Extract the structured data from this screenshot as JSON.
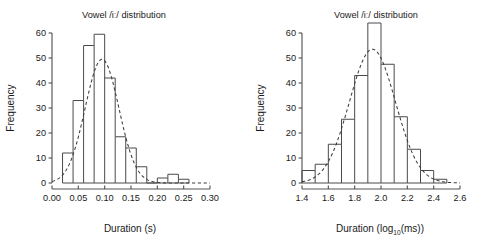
{
  "figure": {
    "background": "#ffffff",
    "ink_color": "#1a1a1a",
    "axis_color": "#555555",
    "bar_color": "#4a4a4a",
    "curve_color": "#3c3c3c"
  },
  "chart_data": [
    {
      "panel": "left",
      "type": "bar",
      "title": "Vowel /iː/ distribution",
      "xlabel": "Duration (s)",
      "ylabel": "Frequency",
      "xlim": [
        0.0,
        0.3
      ],
      "ylim": [
        0,
        60
      ],
      "xticks": [
        0.0,
        0.05,
        0.1,
        0.15,
        0.2,
        0.25,
        0.3
      ],
      "xtick_labels": [
        "0.00",
        "0.05",
        "0.10",
        "0.15",
        "0.20",
        "0.25",
        "0.30"
      ],
      "yticks": [
        0,
        10,
        20,
        30,
        40,
        50,
        60
      ],
      "ytick_labels": [
        "0",
        "10",
        "20",
        "30",
        "40",
        "50",
        "60"
      ],
      "grid": false,
      "legend": "none",
      "bin_width": 0.02,
      "bin_edges": [
        0.02,
        0.04,
        0.06,
        0.08,
        0.1,
        0.12,
        0.14,
        0.16,
        0.18,
        0.2,
        0.22,
        0.24,
        0.26
      ],
      "categories": [
        "0.02-0.04",
        "0.04-0.06",
        "0.06-0.08",
        "0.08-0.10",
        "0.10-0.12",
        "0.12-0.14",
        "0.14-0.16",
        "0.16-0.18",
        "0.18-0.20",
        "0.20-0.22",
        "0.22-0.24",
        "0.24-0.26"
      ],
      "values": [
        12,
        33,
        55,
        59.5,
        42,
        18.5,
        14,
        6.5,
        0,
        2,
        3.5,
        1.5
      ],
      "overlay": {
        "name": "normal density fit",
        "style": "dashed",
        "mean": 0.095,
        "sd": 0.032,
        "peak": 49.5
      }
    },
    {
      "panel": "right",
      "type": "bar",
      "title": "Vowel /iː/ distribution",
      "xlabel": "Duration (log10(ms))",
      "xlabel_base": "Duration (log",
      "xlabel_sub": "10",
      "xlabel_tail": "(ms))",
      "ylabel": "Frequency",
      "xlim": [
        1.4,
        2.6
      ],
      "ylim": [
        0,
        60
      ],
      "xticks": [
        1.4,
        1.6,
        1.8,
        2.0,
        2.2,
        2.4,
        2.6
      ],
      "xtick_labels": [
        "1.4",
        "1.6",
        "1.8",
        "2.0",
        "2.2",
        "2.4",
        "2.6"
      ],
      "yticks": [
        0,
        10,
        20,
        30,
        40,
        50,
        60
      ],
      "ytick_labels": [
        "0",
        "10",
        "20",
        "30",
        "40",
        "50",
        "60"
      ],
      "grid": false,
      "legend": "none",
      "bin_width": 0.1,
      "bin_edges": [
        1.4,
        1.5,
        1.6,
        1.7,
        1.8,
        1.9,
        2.0,
        2.1,
        2.2,
        2.3,
        2.4,
        2.5
      ],
      "categories": [
        "1.4-1.5",
        "1.5-1.6",
        "1.6-1.7",
        "1.7-1.8",
        "1.8-1.9",
        "1.9-2.0",
        "2.0-2.1",
        "2.1-2.2",
        "2.2-2.3",
        "2.3-2.4",
        "2.4-2.5"
      ],
      "values": [
        5,
        7.5,
        15.5,
        25.5,
        43,
        64,
        47.5,
        26.5,
        13.5,
        5,
        1.5
      ],
      "overlay": {
        "name": "normal density fit",
        "style": "dashed",
        "mean": 1.935,
        "sd": 0.175,
        "peak": 53.5
      }
    }
  ]
}
